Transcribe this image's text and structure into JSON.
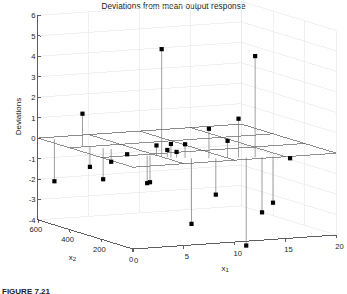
{
  "figure": {
    "title": "Deviations from mean output response",
    "caption": "FIGURE 7.21",
    "background": "#ffffff",
    "axis_color": "#4d4d4d",
    "grid_color": "#e8e8e8",
    "plane_color": "#555555",
    "marker_color": "#000000",
    "stem_color": "#777777"
  },
  "chart_data": {
    "type": "scatter",
    "subtype": "stem3",
    "title": "Deviations from mean output response",
    "xlabel": "x_1",
    "ylabel": "x_2",
    "zlabel": "Deviations",
    "grid": true,
    "legend": null,
    "legend_position": "none",
    "x1_axis": {
      "label": "x1",
      "ticks": [
        0,
        5,
        10,
        15,
        20
      ],
      "tick_labels": [
        "0",
        "5",
        "10",
        "15",
        "20"
      ],
      "range": [
        0,
        20
      ]
    },
    "x2_axis": {
      "label": "x2",
      "ticks": [
        0,
        200,
        400,
        600
      ],
      "tick_labels": [
        "0",
        "200",
        "400",
        "600"
      ],
      "range": [
        0,
        600
      ],
      "reversed": true
    },
    "z_axis": {
      "label": "Deviations",
      "ticks": [
        -4,
        -3,
        -2,
        -1,
        0,
        1,
        2,
        3,
        4,
        5,
        6
      ],
      "tick_labels": [
        "-4",
        "-3",
        "-2",
        "-1",
        "0",
        "1",
        "2",
        "3",
        "4",
        "5",
        "6"
      ],
      "range": [
        -4,
        6
      ]
    },
    "reference_plane": 0,
    "points": [
      {
        "x1": 1.0,
        "x2": 560,
        "z": -2.05
      },
      {
        "x1": 1.5,
        "x2": 415,
        "z": 1.58
      },
      {
        "x1": 2.0,
        "x2": 400,
        "z": -1.0
      },
      {
        "x1": 2.6,
        "x2": 355,
        "z": -1.52
      },
      {
        "x1": 3.0,
        "x2": 330,
        "z": -0.62
      },
      {
        "x1": 3.4,
        "x2": 255,
        "z": -0.09
      },
      {
        "x1": 4.2,
        "x2": 180,
        "z": -1.35
      },
      {
        "x1": 4.4,
        "x2": 175,
        "z": -1.3
      },
      {
        "x1": 4.8,
        "x2": 160,
        "z": 0.52
      },
      {
        "x1": 5.0,
        "x2": 140,
        "z": 5.27
      },
      {
        "x1": 5.4,
        "x2": 130,
        "z": 0.35
      },
      {
        "x1": 5.6,
        "x2": 120,
        "z": 0.66
      },
      {
        "x1": 6.0,
        "x2": 110,
        "z": 0.28
      },
      {
        "x1": 6.6,
        "x2": 95,
        "z": 0.67
      },
      {
        "x1": 7.0,
        "x2": 80,
        "z": -3.2
      },
      {
        "x1": 8.4,
        "x2": 60,
        "z": 1.45
      },
      {
        "x1": 9.0,
        "x2": 55,
        "z": -1.78
      },
      {
        "x1": 10.0,
        "x2": 45,
        "z": 0.84
      },
      {
        "x1": 11.0,
        "x2": 40,
        "z": 1.9
      },
      {
        "x1": 11.6,
        "x2": 30,
        "z": -4.3
      },
      {
        "x1": 12.4,
        "x2": 25,
        "z": 4.95
      },
      {
        "x1": 13.0,
        "x2": 20,
        "z": -2.7
      },
      {
        "x1": 14.0,
        "x2": 15,
        "z": -2.25
      },
      {
        "x1": 15.6,
        "x2": 10,
        "z": -0.12
      }
    ]
  }
}
